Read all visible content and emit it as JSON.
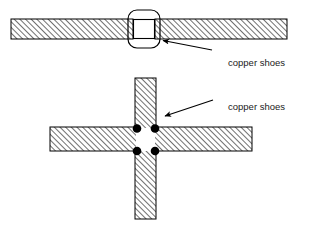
{
  "figure": {
    "title": "",
    "background_color": "#ffffff",
    "line_color": "#000000",
    "hatch_color": "#555555",
    "shoe_fill": "#ffffff",
    "dot_color": "#000000"
  },
  "labels": {
    "top_label": "copper shoes",
    "bottom_label": "copper shoes"
  },
  "top_view": {
    "name": "elevation-view",
    "bar": {
      "x": 11,
      "y": 19,
      "width": 276,
      "height": 20
    },
    "gap": {
      "x": 133,
      "y": 19,
      "width": 22,
      "height": 20
    },
    "shoe_outline": {
      "x": 128,
      "y": 10,
      "width": 32,
      "height": 38,
      "corner_radius": 8
    },
    "arrow": {
      "from_x": 211,
      "from_y": 49,
      "to_x": 159,
      "to_y": 40
    }
  },
  "bottom_view": {
    "name": "plan-view",
    "vertical_bar": {
      "x": 135,
      "y": 78,
      "width": 21,
      "height": 141
    },
    "horizontal_bar": {
      "x": 50,
      "y": 127,
      "width": 202,
      "height": 24
    },
    "gap": {
      "x": 137,
      "y": 129,
      "width": 17,
      "height": 21
    },
    "dots": [
      {
        "cx": 137,
        "cy": 128,
        "r": 4
      },
      {
        "cx": 155,
        "cy": 128,
        "r": 4
      },
      {
        "cx": 137,
        "cy": 151,
        "r": 4
      },
      {
        "cx": 155,
        "cy": 151,
        "r": 4
      }
    ],
    "arrow": {
      "from_x": 212,
      "from_y": 101,
      "to_x": 163,
      "to_y": 116
    }
  },
  "label_positions": {
    "top": {
      "x": 228,
      "y": 65
    },
    "bottom": {
      "x": 228,
      "y": 110
    }
  }
}
